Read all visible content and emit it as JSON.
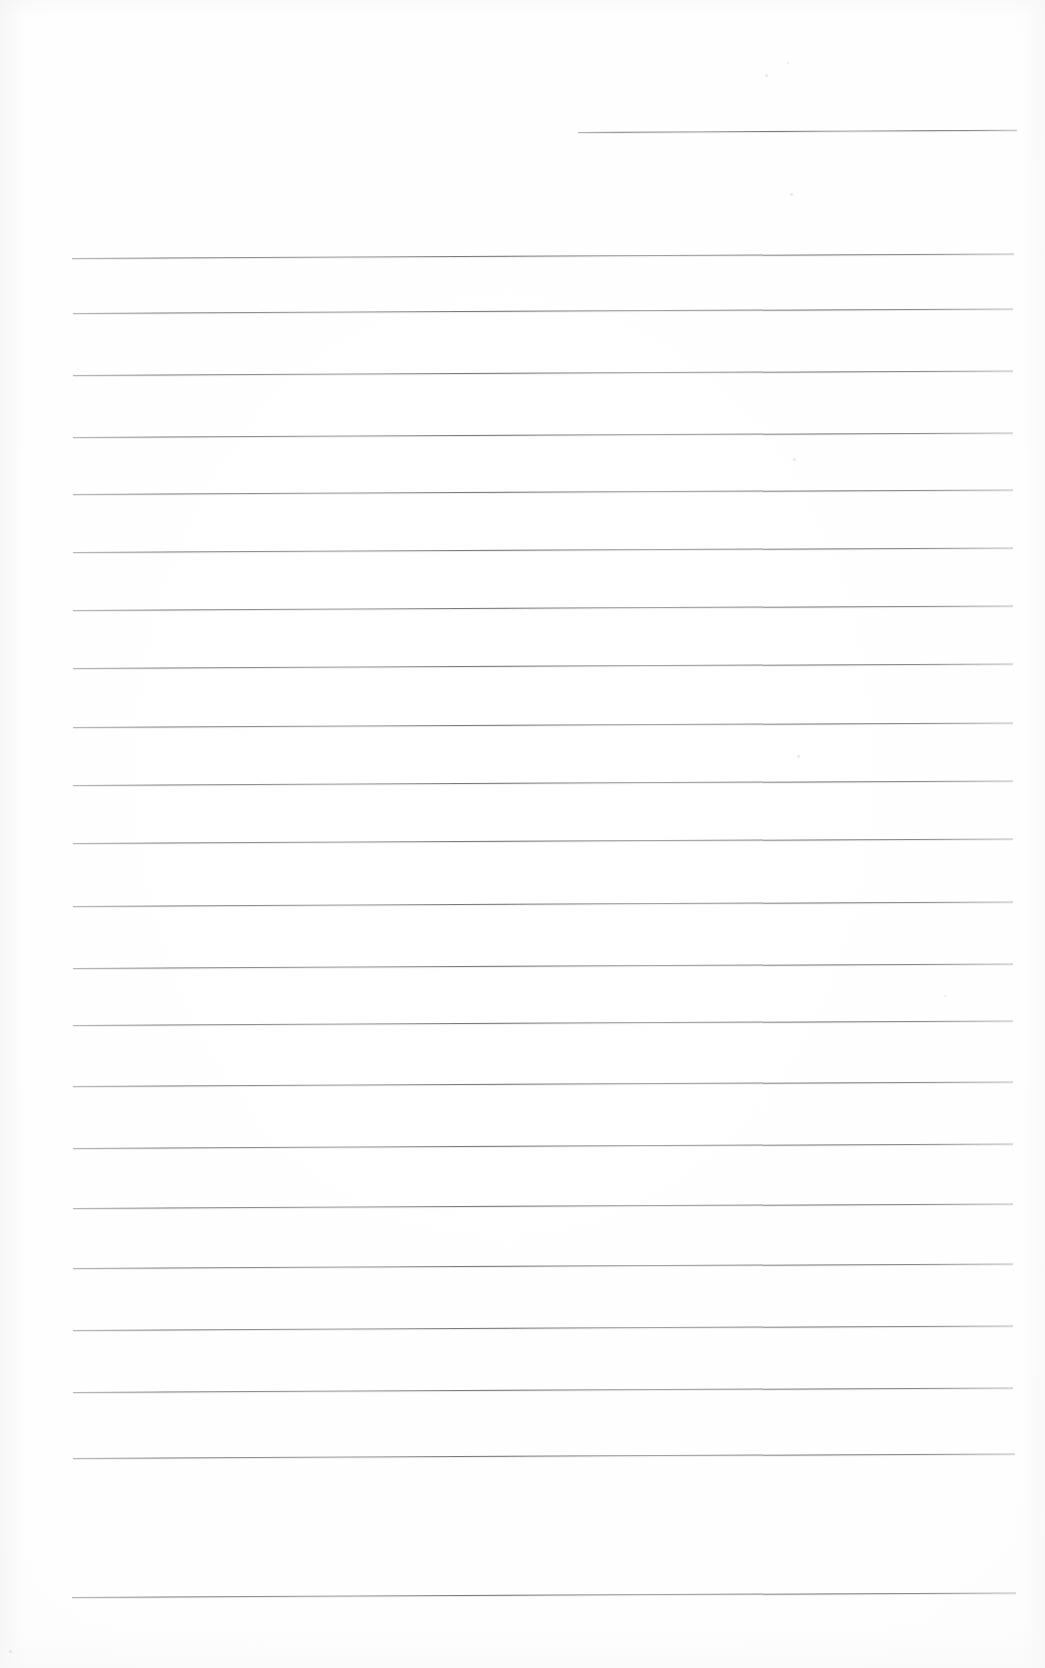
{
  "document": {
    "kind": "scanned-page",
    "title": "Blank ruled notebook page",
    "description": "A scanned sheet of blank ruled writing paper. No handwriting, headings, page numbers or other printed text are present — only the horizontal ruled lines on off-white paper.",
    "page_width": 1045,
    "page_height": 1668,
    "background_color": "#fefefe",
    "rule_color": "#5f6268",
    "has_text_content": false,
    "text_content": "",
    "ruling": {
      "style": "wide-ruled horizontal lines",
      "total_lines": 23,
      "line_spacing_px": 63.5,
      "line_thickness_px": 1,
      "left_margin_px": 72,
      "right_margin_px": 1015,
      "skew_degrees": -0.28,
      "has_vertical_margin_rule": false,
      "has_holes": false
    },
    "lines": [
      {
        "index": 1,
        "y": 132,
        "x_start": 578,
        "x_end": 1017,
        "partial": true
      },
      {
        "index": 2,
        "y": 258,
        "x_start": 72,
        "x_end": 1014,
        "partial": false
      },
      {
        "index": 3,
        "y": 313,
        "x_start": 73,
        "x_end": 1013,
        "partial": false
      },
      {
        "index": 4,
        "y": 375,
        "x_start": 73,
        "x_end": 1013,
        "partial": false
      },
      {
        "index": 5,
        "y": 437,
        "x_start": 73,
        "x_end": 1013,
        "partial": false
      },
      {
        "index": 6,
        "y": 494,
        "x_start": 73,
        "x_end": 1013,
        "partial": false
      },
      {
        "index": 7,
        "y": 552,
        "x_start": 73,
        "x_end": 1013,
        "partial": false
      },
      {
        "index": 8,
        "y": 610,
        "x_start": 73,
        "x_end": 1013,
        "partial": false
      },
      {
        "index": 9,
        "y": 668,
        "x_start": 73,
        "x_end": 1013,
        "partial": false
      },
      {
        "index": 10,
        "y": 727,
        "x_start": 73,
        "x_end": 1013,
        "partial": false
      },
      {
        "index": 11,
        "y": 785,
        "x_start": 73,
        "x_end": 1013,
        "partial": false
      },
      {
        "index": 12,
        "y": 843,
        "x_start": 73,
        "x_end": 1013,
        "partial": false
      },
      {
        "index": 13,
        "y": 906,
        "x_start": 73,
        "x_end": 1013,
        "partial": false
      },
      {
        "index": 14,
        "y": 968,
        "x_start": 73,
        "x_end": 1013,
        "partial": false
      },
      {
        "index": 15,
        "y": 1025,
        "x_start": 73,
        "x_end": 1013,
        "partial": false
      },
      {
        "index": 16,
        "y": 1086,
        "x_start": 73,
        "x_end": 1013,
        "partial": false
      },
      {
        "index": 17,
        "y": 1148,
        "x_start": 73,
        "x_end": 1013,
        "partial": false
      },
      {
        "index": 18,
        "y": 1208,
        "x_start": 73,
        "x_end": 1013,
        "partial": false
      },
      {
        "index": 19,
        "y": 1268,
        "x_start": 73,
        "x_end": 1013,
        "partial": false
      },
      {
        "index": 20,
        "y": 1330,
        "x_start": 73,
        "x_end": 1013,
        "partial": false
      },
      {
        "index": 21,
        "y": 1392,
        "x_start": 73,
        "x_end": 1013,
        "partial": false
      },
      {
        "index": 22,
        "y": 1458,
        "x_start": 73,
        "x_end": 1015,
        "partial": false
      },
      {
        "index": 23,
        "y": 1597,
        "x_start": 72,
        "x_end": 1016,
        "partial": false
      }
    ],
    "specks": [
      {
        "x": 765,
        "y": 74,
        "size": 3
      },
      {
        "x": 787,
        "y": 62,
        "size": 2
      },
      {
        "x": 790,
        "y": 193,
        "size": 3
      },
      {
        "x": 793,
        "y": 458,
        "size": 3
      },
      {
        "x": 797,
        "y": 755,
        "size": 3
      },
      {
        "x": 944,
        "y": 995,
        "size": 2
      },
      {
        "x": 9,
        "y": 1650,
        "size": 3
      }
    ]
  }
}
